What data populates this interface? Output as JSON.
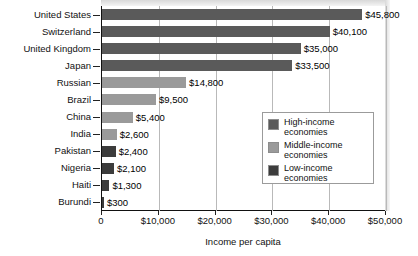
{
  "chart_data": {
    "type": "bar",
    "orientation": "horizontal",
    "title": "",
    "xlabel": "Income per capita",
    "ylabel": "",
    "xlim": [
      0,
      50000
    ],
    "xticks": [
      0,
      10000,
      20000,
      30000,
      40000,
      50000
    ],
    "xtick_labels": [
      "0",
      "$10,000",
      "$20,000",
      "$30,000",
      "$40,000",
      "$50,000"
    ],
    "grid": true,
    "legend_position": "inside-right",
    "categories": [
      "United States",
      "Switzerland",
      "United Kingdom",
      "Japan",
      "Russian",
      "Brazil",
      "China",
      "India",
      "Pakistan",
      "Nigeria",
      "Haiti",
      "Burundi"
    ],
    "values": [
      45800,
      40100,
      35000,
      33500,
      14800,
      9500,
      5400,
      2600,
      2400,
      2100,
      1300,
      300
    ],
    "value_labels": [
      "$45,800",
      "$40,100",
      "$35,000",
      "$33,500",
      "$14,800",
      "$9,500",
      "$5,400",
      "$2,600",
      "$2,400",
      "$2,100",
      "$1,300",
      "$300"
    ],
    "groups": [
      "high",
      "high",
      "high",
      "high",
      "middle",
      "middle",
      "middle",
      "middle",
      "low",
      "low",
      "low",
      "low"
    ],
    "colors": {
      "high": "#5a5a5a",
      "middle": "#9a9a9a",
      "low": "#3c3c3c"
    },
    "legend": [
      {
        "key": "high",
        "label": "High-income economies"
      },
      {
        "key": "middle",
        "label": "Middle-income economies"
      },
      {
        "key": "low",
        "label": "Low-income economies"
      }
    ]
  }
}
